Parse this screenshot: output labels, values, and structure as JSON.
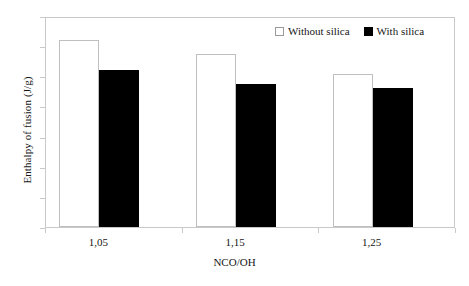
{
  "chart_data": {
    "type": "bar",
    "title": "",
    "xlabel": "NCO/OH",
    "ylabel": "Enthalpy of fusion (J/g)",
    "categories": [
      "1,05",
      "1,15",
      "1,25"
    ],
    "series": [
      {
        "name": "Without silica",
        "color": "#ffffff",
        "values": [
          31.0,
          28.7,
          25.3
        ]
      },
      {
        "name": "With silica",
        "color": "#000000",
        "values": [
          26.0,
          23.7,
          23.0
        ]
      }
    ],
    "ylim": [
      0,
      35
    ],
    "ytick_step": 5,
    "yticks": [
      "0",
      "5",
      "10",
      "15",
      "20",
      "25",
      "30",
      "35"
    ],
    "grid": false,
    "legend_position": "top-right-inside"
  },
  "legend": {
    "entries": [
      {
        "label": "Without silica",
        "marker": "open-square-marker"
      },
      {
        "label": "With silica",
        "marker": "filled-square-marker"
      }
    ]
  }
}
